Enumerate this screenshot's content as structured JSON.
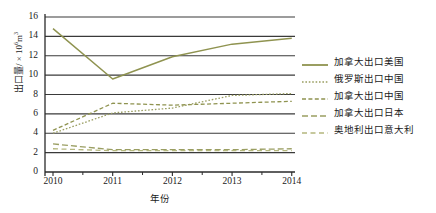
{
  "chart_data": {
    "type": "line",
    "title": "",
    "xlabel": "年份",
    "ylabel": "出口量/ × 10⁶m³",
    "ylabel_main": "出口量/ × 10",
    "ylabel_exp": "6",
    "ylabel_unit": "m",
    "ylabel_unit_exp": "3",
    "categories": [
      "2010",
      "2011",
      "2012",
      "2013",
      "2014"
    ],
    "x": [
      2010,
      2011,
      2012,
      2013,
      2014
    ],
    "ylim": [
      0,
      16
    ],
    "yticks": [
      0,
      2,
      4,
      6,
      8,
      10,
      12,
      14,
      16
    ],
    "xlim": [
      2009.7,
      2014.3
    ],
    "grid": "horizontal",
    "legend_position": "right",
    "series": [
      {
        "name": "加拿大出口美国",
        "style": "solid",
        "color": "#8f9350",
        "values": [
          14.8,
          9.6,
          11.9,
          13.2,
          13.8
        ]
      },
      {
        "name": "俄罗斯出口中国",
        "style": "dotted",
        "color": "#9a9e62",
        "values": [
          4.0,
          6.1,
          6.6,
          7.9,
          8.1
        ]
      },
      {
        "name": "加拿大出口中国",
        "style": "dashed",
        "color": "#8f9350",
        "values": [
          4.3,
          7.1,
          6.9,
          7.1,
          7.3
        ]
      },
      {
        "name": "加拿大出口日本",
        "style": "long-dash",
        "color": "#9a9e62",
        "values": [
          2.9,
          2.3,
          2.3,
          2.3,
          2.4
        ]
      },
      {
        "name": "奥地利出口意大利",
        "style": "dash-gap",
        "color": "#b4b77e",
        "values": [
          2.4,
          2.2,
          2.2,
          2.2,
          2.2
        ]
      }
    ]
  },
  "axes": {
    "ytick_labels": [
      "16",
      "14",
      "12",
      "10",
      "8",
      "6",
      "4",
      "2",
      "0"
    ],
    "xtick_labels": [
      "2010",
      "2011",
      "2012",
      "2013",
      "2014"
    ],
    "x_axis_title": "年份"
  },
  "legend": {
    "items": [
      {
        "label": "加拿大出口美国"
      },
      {
        "label": "俄罗斯出口中国"
      },
      {
        "label": "加拿大出口中国"
      },
      {
        "label": "加拿大出口日本"
      },
      {
        "label": "奥地利出口意大利"
      }
    ]
  },
  "colors": {
    "line_primary": "#8f9350",
    "line_secondary": "#9a9e62",
    "line_light": "#b4b77e",
    "grid": "#3a3a3a",
    "axis": "#2a2a2a",
    "background": "#ffffff"
  }
}
